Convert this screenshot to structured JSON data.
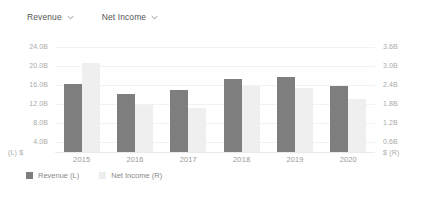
{
  "selectors": [
    {
      "label": "Revenue",
      "icon": "chevron-down-icon"
    },
    {
      "label": "Net Income",
      "icon": "chevron-down-icon"
    }
  ],
  "axes": {
    "left_unit": "(L)  $",
    "right_unit": "$  (R)",
    "left_ticks": [
      "24.0B",
      "20.0B",
      "16.0B",
      "12.0B",
      "8.0B",
      "4.0B"
    ],
    "right_ticks": [
      "3.6B",
      "3.0B",
      "2.4B",
      "1.8B",
      "1.2B",
      "0.6B"
    ]
  },
  "legend": [
    {
      "label": "Revenue (L)",
      "color": "#7e7e7e"
    },
    {
      "label": "Net Income (R)",
      "color": "#ededed"
    }
  ],
  "chart_data": {
    "type": "bar",
    "title": "",
    "xlabel": "",
    "ylabel": "",
    "grid": true,
    "legend_position": "bottom-left",
    "categories": [
      "2015",
      "2016",
      "2017",
      "2018",
      "2019",
      "2020"
    ],
    "series": [
      {
        "name": "Revenue (L)",
        "axis": "left",
        "color": "#7e7e7e",
        "unit": "B",
        "values": [
          16.5,
          14.0,
          15.0,
          17.5,
          18.0,
          16.0
        ],
        "tick_labels": [
          "24.0B",
          "20.0B",
          "16.0B",
          "12.0B",
          "8.0B",
          "4.0B"
        ],
        "ylim": [
          0,
          26
        ]
      },
      {
        "name": "Net Income (R)",
        "axis": "right",
        "color": "#ededed",
        "unit": "B",
        "values": [
          3.2,
          1.7,
          1.6,
          2.4,
          2.3,
          1.9
        ],
        "tick_labels": [
          "3.6B",
          "3.0B",
          "2.4B",
          "1.8B",
          "1.2B",
          "0.6B"
        ],
        "ylim": [
          0,
          3.9
        ]
      }
    ]
  }
}
